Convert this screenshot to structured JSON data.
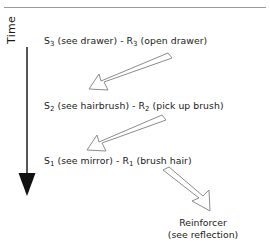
{
  "figure": {
    "axis_label": "Time",
    "reinforcer": {
      "title": "Reinforcer",
      "subtitle": "(see reflection)"
    }
  },
  "chain": [
    {
      "stimulus_symbol": "S",
      "stimulus_index": "3",
      "stimulus_text": " (see drawer)",
      "separator": " - ",
      "response_symbol": "R",
      "response_index": "3",
      "response_text": " (open drawer)"
    },
    {
      "stimulus_symbol": "S",
      "stimulus_index": "2",
      "stimulus_text": " (see hairbrush)",
      "separator": " - ",
      "response_symbol": "R",
      "response_index": "2",
      "response_text": " (pick up brush)"
    },
    {
      "stimulus_symbol": "S",
      "stimulus_index": "1",
      "stimulus_text": " (see mirror)",
      "separator": " - ",
      "response_symbol": "R",
      "response_index": "1",
      "response_text": " (brush hair)"
    }
  ],
  "colors": {
    "rule": "#9a9a9a",
    "text": "#1a1a1a",
    "axis": "#2b2b2b",
    "arrow_outline": "#8c8c8c"
  }
}
